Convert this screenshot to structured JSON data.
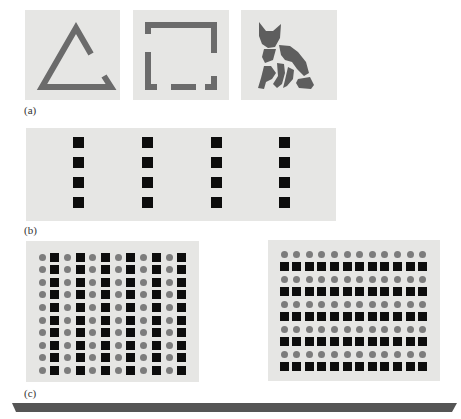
{
  "figure": {
    "part_a": {
      "label": "(a)",
      "panels": [
        {
          "name": "incomplete-triangle",
          "shape": "triangle-outline-with-gap"
        },
        {
          "name": "incomplete-square",
          "shape": "square-outline-with-gaps"
        },
        {
          "name": "fragmented-cat",
          "shape": "cat-silhouette-fragments"
        }
      ],
      "figure_color": "#6b6b6b",
      "background_color": "#e6e6e4"
    },
    "part_b": {
      "label": "(b)",
      "columns": 4,
      "squares_per_column": 4,
      "square_color": "#0d0d0d"
    },
    "part_c": {
      "label": "(c)",
      "left_grid": {
        "rows": 10,
        "cols": 12,
        "pattern": "columns-alternate-circle-square"
      },
      "right_grid": {
        "rows": 10,
        "cols": 12,
        "pattern": "rows-alternate-circle-square"
      },
      "circle_color": "#7c7c7c",
      "square_color": "#0d0d0d"
    },
    "bottom_bar_color": "#555555"
  }
}
